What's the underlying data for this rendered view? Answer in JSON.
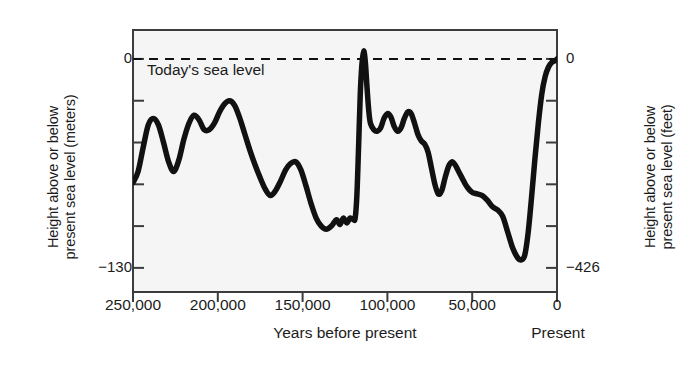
{
  "chart_data": {
    "type": "line",
    "title": "",
    "xlabel": "Years before present",
    "ylabel": "Height above or below present sea level (meters)",
    "y2label": "Height above or below present sea level (feet)",
    "xlim": [
      250000,
      0
    ],
    "ylim": [
      -145,
      18
    ],
    "y2lim": [
      -475,
      59
    ],
    "grid": false,
    "legend": null,
    "x_ticks": [
      "250,000",
      "200,000",
      "150,000",
      "100,000",
      "50,000",
      "0"
    ],
    "x_tick_values": [
      250000,
      200000,
      150000,
      100000,
      50000,
      0
    ],
    "y_ticks_left": [
      "0",
      "-130"
    ],
    "y_tick_values_left": [
      0,
      -130
    ],
    "y_ticks_right": [
      "0",
      "-426"
    ],
    "y_tick_values_right": [
      0,
      -426
    ],
    "x_axis_end_label": "Present",
    "annotations": [
      {
        "text": "Today's sea level",
        "x": 236000,
        "y": 10,
        "kind": "dashed-reference-line",
        "line_y": 0
      }
    ],
    "series": [
      {
        "name": "Sea level",
        "color": "#111111",
        "points": [
          [
            250000,
            -77
          ],
          [
            247000,
            -70
          ],
          [
            244000,
            -55
          ],
          [
            241000,
            -41
          ],
          [
            238000,
            -37
          ],
          [
            235000,
            -41
          ],
          [
            232000,
            -52
          ],
          [
            229000,
            -64
          ],
          [
            226000,
            -70
          ],
          [
            223000,
            -63
          ],
          [
            220000,
            -50
          ],
          [
            217000,
            -40
          ],
          [
            214000,
            -35
          ],
          [
            211000,
            -38
          ],
          [
            208000,
            -44
          ],
          [
            205000,
            -44
          ],
          [
            202000,
            -40
          ],
          [
            199000,
            -33
          ],
          [
            196000,
            -28
          ],
          [
            193000,
            -26
          ],
          [
            190000,
            -29
          ],
          [
            187000,
            -37
          ],
          [
            184000,
            -47
          ],
          [
            181000,
            -57
          ],
          [
            178000,
            -66
          ],
          [
            175000,
            -74
          ],
          [
            172000,
            -81
          ],
          [
            169000,
            -85
          ],
          [
            166000,
            -82
          ],
          [
            163000,
            -76
          ],
          [
            160000,
            -69
          ],
          [
            157000,
            -65
          ],
          [
            154000,
            -64
          ],
          [
            151000,
            -69
          ],
          [
            148000,
            -79
          ],
          [
            145000,
            -90
          ],
          [
            142000,
            -99
          ],
          [
            139000,
            -104
          ],
          [
            136000,
            -106
          ],
          [
            133000,
            -104
          ],
          [
            130000,
            -100
          ],
          [
            128000,
            -103
          ],
          [
            126000,
            -99
          ],
          [
            124000,
            -102
          ],
          [
            122000,
            -99
          ],
          [
            120000,
            -100
          ],
          [
            119000,
            -99
          ],
          [
            118000,
            -85
          ],
          [
            117000,
            -55
          ],
          [
            116000,
            -22
          ],
          [
            115000,
            -3
          ],
          [
            114000,
            5
          ],
          [
            113000,
            -2
          ],
          [
            112000,
            -18
          ],
          [
            111000,
            -32
          ],
          [
            110000,
            -40
          ],
          [
            108000,
            -44
          ],
          [
            106000,
            -45
          ],
          [
            104000,
            -43
          ],
          [
            102000,
            -37
          ],
          [
            100000,
            -34
          ],
          [
            98000,
            -36
          ],
          [
            96000,
            -42
          ],
          [
            94000,
            -45
          ],
          [
            92000,
            -43
          ],
          [
            90000,
            -37
          ],
          [
            88000,
            -33
          ],
          [
            86000,
            -34
          ],
          [
            84000,
            -40
          ],
          [
            82000,
            -47
          ],
          [
            80000,
            -51
          ],
          [
            78000,
            -53
          ],
          [
            76000,
            -58
          ],
          [
            74000,
            -68
          ],
          [
            72000,
            -78
          ],
          [
            70000,
            -84
          ],
          [
            68000,
            -82
          ],
          [
            66000,
            -74
          ],
          [
            64000,
            -67
          ],
          [
            62000,
            -64
          ],
          [
            60000,
            -66
          ],
          [
            58000,
            -70
          ],
          [
            56000,
            -74
          ],
          [
            54000,
            -78
          ],
          [
            52000,
            -81
          ],
          [
            50000,
            -83
          ],
          [
            47000,
            -84
          ],
          [
            44000,
            -85
          ],
          [
            41000,
            -88
          ],
          [
            38000,
            -92
          ],
          [
            35000,
            -94
          ],
          [
            32000,
            -98
          ],
          [
            29000,
            -108
          ],
          [
            26000,
            -118
          ],
          [
            23000,
            -124
          ],
          [
            21000,
            -125
          ],
          [
            19000,
            -122
          ],
          [
            17000,
            -108
          ],
          [
            15000,
            -86
          ],
          [
            13000,
            -62
          ],
          [
            11000,
            -40
          ],
          [
            9000,
            -22
          ],
          [
            7000,
            -11
          ],
          [
            5000,
            -5
          ],
          [
            3000,
            -2
          ],
          [
            1000,
            -1
          ],
          [
            0,
            0
          ]
        ]
      }
    ]
  },
  "axes": {
    "left": {
      "title_line1": "Height above or below",
      "title_line2": "present sea level (meters)",
      "tick_0": "0",
      "tick_min": "−130"
    },
    "right": {
      "title_line1": "Height above or below",
      "title_line2": "present sea level (feet)",
      "tick_0": "0",
      "tick_min": "−426"
    },
    "bottom": {
      "title": "Years before present",
      "end_label": "Present",
      "ticks": [
        "250,000",
        "200,000",
        "150,000",
        "100,000",
        "50,000",
        "0"
      ]
    }
  },
  "annotation": {
    "sea_level_text": "Today's sea level"
  },
  "style": {
    "plot_background": "#f5f5f5",
    "frame_color": "#3c3c3c",
    "curve_color": "#111111",
    "text_color": "#1c1c1c"
  }
}
